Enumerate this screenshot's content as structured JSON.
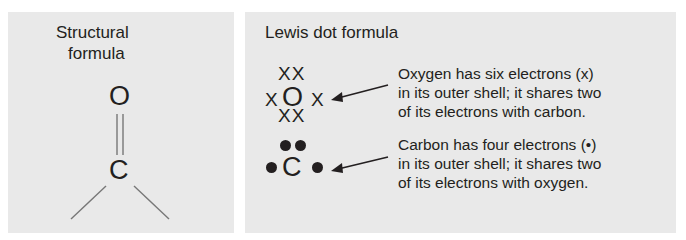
{
  "structural_panel": {
    "title_line1": "Structural",
    "title_line2": "formula",
    "atom_top": "O",
    "atom_bottom": "C",
    "bond_type": "double-bond"
  },
  "lewis_panel": {
    "title": "Lewis dot formula",
    "oxygen": {
      "symbol": "O",
      "electron_mark": "x",
      "top_marks": "XX",
      "left_mark": "X",
      "right_mark": "X",
      "bottom_marks": "XX",
      "note_lines": [
        "Oxygen has six electrons (x)",
        "in its outer shell; it shares two",
        "of its electrons with carbon."
      ]
    },
    "carbon": {
      "symbol": "C",
      "electron_mark": "•",
      "note_lines": [
        "Carbon has four electrons (•)",
        "in its outer shell; it shares two",
        "of its electrons with oxygen."
      ]
    }
  },
  "colors": {
    "panel_bg": "#e9e9e9",
    "ink": "#231f20",
    "bond_line": "#777777"
  }
}
